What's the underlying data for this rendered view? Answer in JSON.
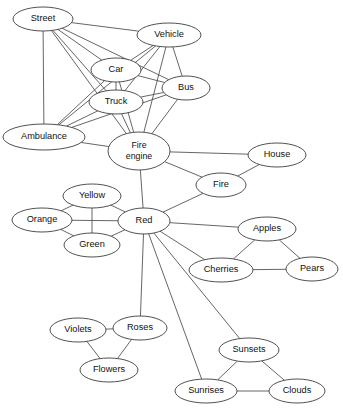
{
  "diagram": {
    "type": "semantic-network-graph",
    "canvas": {
      "width": 343,
      "height": 416
    },
    "style": {
      "background_color": "#ffffff",
      "node_fill": "#ffffff",
      "node_stroke": "#3d3d3d",
      "edge_stroke": "#4a4a4a",
      "label_color": "#111111"
    },
    "nodes": [
      {
        "id": "street",
        "label": "Street",
        "cx": 43,
        "cy": 19,
        "rx": 30,
        "ry": 12
      },
      {
        "id": "vehicle",
        "label": "Vehicle",
        "cx": 169,
        "cy": 35,
        "rx": 32,
        "ry": 12
      },
      {
        "id": "car",
        "label": "Car",
        "cx": 116,
        "cy": 70,
        "rx": 25,
        "ry": 12
      },
      {
        "id": "bus",
        "label": "Bus",
        "cx": 186,
        "cy": 88,
        "rx": 24,
        "ry": 12
      },
      {
        "id": "truck",
        "label": "Truck",
        "cx": 116,
        "cy": 102,
        "rx": 27,
        "ry": 12
      },
      {
        "id": "ambulance",
        "label": "Ambulance",
        "cx": 44,
        "cy": 137,
        "rx": 41,
        "ry": 13
      },
      {
        "id": "fire_engine",
        "label": "Fire engine",
        "cx": 139,
        "cy": 151,
        "rx": 31,
        "ry": 19,
        "two_line": true
      },
      {
        "id": "house",
        "label": "House",
        "cx": 277,
        "cy": 155,
        "rx": 29,
        "ry": 12
      },
      {
        "id": "fire",
        "label": "Fire",
        "cx": 221,
        "cy": 185,
        "rx": 25,
        "ry": 12
      },
      {
        "id": "yellow",
        "label": "Yellow",
        "cx": 92,
        "cy": 196,
        "rx": 29,
        "ry": 12
      },
      {
        "id": "orange",
        "label": "Orange",
        "cx": 42,
        "cy": 220,
        "rx": 30,
        "ry": 12
      },
      {
        "id": "red",
        "label": "Red",
        "cx": 144,
        "cy": 221,
        "rx": 26,
        "ry": 13
      },
      {
        "id": "apples",
        "label": "Apples",
        "cx": 267,
        "cy": 229,
        "rx": 29,
        "ry": 12
      },
      {
        "id": "green",
        "label": "Green",
        "cx": 92,
        "cy": 245,
        "rx": 28,
        "ry": 12
      },
      {
        "id": "cherries",
        "label": "Cherries",
        "cx": 221,
        "cy": 270,
        "rx": 32,
        "ry": 12
      },
      {
        "id": "pears",
        "label": "Pears",
        "cx": 312,
        "cy": 269,
        "rx": 26,
        "ry": 12
      },
      {
        "id": "violets",
        "label": "Violets",
        "cx": 78,
        "cy": 330,
        "rx": 28,
        "ry": 12
      },
      {
        "id": "roses",
        "label": "Roses",
        "cx": 140,
        "cy": 328,
        "rx": 27,
        "ry": 12
      },
      {
        "id": "sunsets",
        "label": "Sunsets",
        "cx": 249,
        "cy": 350,
        "rx": 30,
        "ry": 12
      },
      {
        "id": "flowers",
        "label": "Flowers",
        "cx": 109,
        "cy": 370,
        "rx": 29,
        "ry": 12
      },
      {
        "id": "sunrises",
        "label": "Sunrises",
        "cx": 206,
        "cy": 391,
        "rx": 31,
        "ry": 12
      },
      {
        "id": "clouds",
        "label": "Clouds",
        "cx": 297,
        "cy": 391,
        "rx": 28,
        "ry": 12
      }
    ],
    "edges": [
      {
        "source": "street",
        "target": "vehicle"
      },
      {
        "source": "street",
        "target": "car"
      },
      {
        "source": "street",
        "target": "bus"
      },
      {
        "source": "street",
        "target": "truck"
      },
      {
        "source": "street",
        "target": "ambulance"
      },
      {
        "source": "street",
        "target": "fire_engine"
      },
      {
        "source": "vehicle",
        "target": "car"
      },
      {
        "source": "vehicle",
        "target": "bus"
      },
      {
        "source": "vehicle",
        "target": "truck"
      },
      {
        "source": "vehicle",
        "target": "ambulance"
      },
      {
        "source": "vehicle",
        "target": "fire_engine"
      },
      {
        "source": "car",
        "target": "truck"
      },
      {
        "source": "car",
        "target": "bus"
      },
      {
        "source": "car",
        "target": "ambulance"
      },
      {
        "source": "car",
        "target": "fire_engine"
      },
      {
        "source": "bus",
        "target": "truck"
      },
      {
        "source": "bus",
        "target": "ambulance"
      },
      {
        "source": "bus",
        "target": "fire_engine"
      },
      {
        "source": "truck",
        "target": "ambulance"
      },
      {
        "source": "truck",
        "target": "fire_engine"
      },
      {
        "source": "ambulance",
        "target": "fire_engine"
      },
      {
        "source": "fire_engine",
        "target": "house"
      },
      {
        "source": "fire_engine",
        "target": "fire"
      },
      {
        "source": "fire_engine",
        "target": "red"
      },
      {
        "source": "house",
        "target": "fire"
      },
      {
        "source": "fire",
        "target": "red"
      },
      {
        "source": "yellow",
        "target": "orange"
      },
      {
        "source": "yellow",
        "target": "green"
      },
      {
        "source": "yellow",
        "target": "red"
      },
      {
        "source": "orange",
        "target": "green"
      },
      {
        "source": "orange",
        "target": "red"
      },
      {
        "source": "green",
        "target": "red"
      },
      {
        "source": "red",
        "target": "apples"
      },
      {
        "source": "red",
        "target": "cherries"
      },
      {
        "source": "red",
        "target": "roses"
      },
      {
        "source": "red",
        "target": "sunsets"
      },
      {
        "source": "red",
        "target": "sunrises"
      },
      {
        "source": "apples",
        "target": "cherries"
      },
      {
        "source": "apples",
        "target": "pears"
      },
      {
        "source": "cherries",
        "target": "pears"
      },
      {
        "source": "violets",
        "target": "roses"
      },
      {
        "source": "violets",
        "target": "flowers"
      },
      {
        "source": "roses",
        "target": "flowers"
      },
      {
        "source": "sunsets",
        "target": "sunrises"
      },
      {
        "source": "sunsets",
        "target": "clouds"
      },
      {
        "source": "sunrises",
        "target": "clouds"
      }
    ]
  }
}
